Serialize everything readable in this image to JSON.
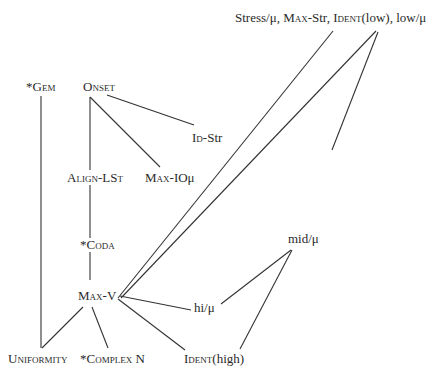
{
  "diagram": {
    "nodes": {
      "stress_group": {
        "part1": "Stress/μ,  ",
        "part2_sc": "Max",
        "part2_rest": "-Str, ",
        "part3_sc": "Ident",
        "part3_rest": "(low), low/μ"
      },
      "gem": {
        "prefix": "*",
        "label": "Gem"
      },
      "onset": {
        "label": "Onset"
      },
      "id_str": {
        "label_sc": "Id",
        "label_rest": "-Str"
      },
      "align_lst": {
        "label": "Align-LSt"
      },
      "max_io": {
        "label_sc": "Max",
        "label_rest": "-IOμ"
      },
      "coda": {
        "prefix": "*",
        "label": "Coda"
      },
      "max_v": {
        "label_sc": "Max",
        "label_rest": "-V"
      },
      "mid_mu": {
        "label": "mid/μ"
      },
      "hi_mu": {
        "label": "hi/μ"
      },
      "uniformity": {
        "label": "Uniformity"
      },
      "complex_n": {
        "prefix": "*",
        "label_sc": "Complex",
        "label_rest": " N"
      },
      "ident_high": {
        "label_sc": "Ident",
        "label_rest": "(high)"
      }
    },
    "edges": [
      {
        "from": "stress_group(Ident(low))",
        "to": "max_v"
      },
      {
        "from": "stress_group(low/μ)",
        "to": "max_v"
      },
      {
        "from": "stress_group(low/μ)",
        "to": "mid_mu"
      },
      {
        "from": "gem",
        "to": "uniformity"
      },
      {
        "from": "onset",
        "to": "align_lst"
      },
      {
        "from": "onset",
        "to": "max_io"
      },
      {
        "from": "onset",
        "to": "id_str"
      },
      {
        "from": "align_lst",
        "to": "coda"
      },
      {
        "from": "coda",
        "to": "max_v"
      },
      {
        "from": "max_v",
        "to": "uniformity"
      },
      {
        "from": "max_v",
        "to": "complex_n"
      },
      {
        "from": "max_v",
        "to": "hi_mu"
      },
      {
        "from": "max_v",
        "to": "ident_high"
      },
      {
        "from": "mid_mu",
        "to": "hi_mu"
      },
      {
        "from": "mid_mu",
        "to": "ident_high"
      }
    ]
  }
}
